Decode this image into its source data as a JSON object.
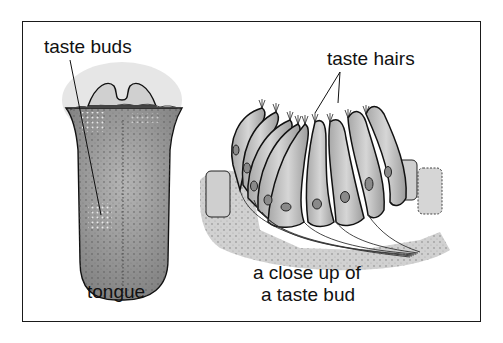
{
  "diagram": {
    "labels": {
      "taste_buds": "taste buds",
      "taste_hairs": "taste hairs",
      "tongue": "tongue",
      "closeup_line1": "a close up of",
      "closeup_line2": "a taste bud"
    },
    "colors": {
      "frame": "#1a1a1a",
      "tissue": "#9a9a9a",
      "cell_fill": "#c4c4c4",
      "outline": "#111111",
      "background": "#ffffff"
    }
  }
}
